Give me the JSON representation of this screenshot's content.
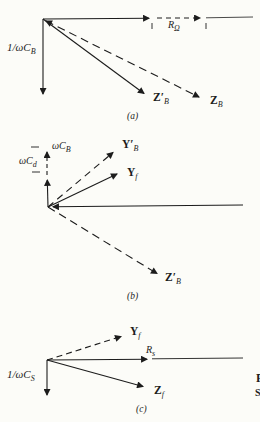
{
  "colors": {
    "ink": "#1c1c1c",
    "paper": "#fcfcf8"
  },
  "figure": {
    "panels": [
      {
        "caption": "(a)",
        "labels": {
          "cap_reactance": {
            "main": "1/ωC",
            "sub": "B"
          },
          "resistance": {
            "main": "R",
            "sub": "Ω"
          },
          "z_prime": {
            "main": "Z′",
            "sub": "B"
          },
          "z": {
            "main": "Z",
            "sub": "B"
          }
        }
      },
      {
        "caption": "(b)",
        "labels": {
          "suscept_total": {
            "main": "ωC",
            "sub": "B"
          },
          "suscept_d": {
            "main": "ωC",
            "sub": "d"
          },
          "y_prime": {
            "main": "Y′",
            "sub": "B"
          },
          "y_f": {
            "main": "Y",
            "sub": "f"
          },
          "z_prime": {
            "main": "Z′",
            "sub": "B"
          }
        }
      },
      {
        "caption": "(c)",
        "labels": {
          "y_f": {
            "main": "Y",
            "sub": "f"
          },
          "resistance": {
            "main": "R",
            "sub": "s"
          },
          "z_f": {
            "main": "Z",
            "sub": "f"
          },
          "cap_reactance": {
            "main": "1/ωC",
            "sub": "S"
          }
        }
      }
    ],
    "edge_fragments": {
      "top": "F",
      "bottom": "S"
    }
  }
}
